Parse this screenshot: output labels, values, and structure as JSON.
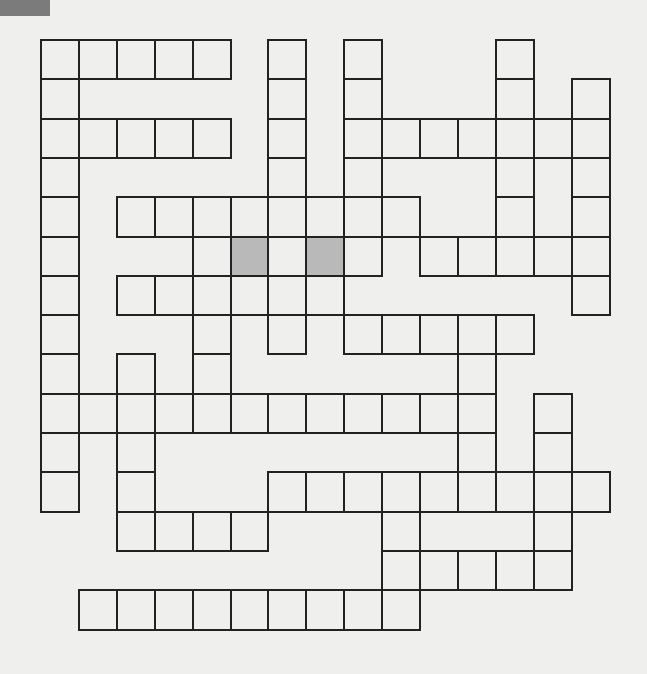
{
  "puzzle": {
    "type": "crossword-grid",
    "rows": 15,
    "cols": 15,
    "origin": {
      "x": 41,
      "y": 40
    },
    "cell_size": {
      "w": 37.9,
      "h": 39.3
    },
    "colors": {
      "background": "#efefed",
      "cell_border": "#222222",
      "cell_fill": "#efefed",
      "shaded_fill": "#b9b9b9",
      "corner_tab": "#7b7b7b"
    },
    "cells_by_row": [
      [
        0,
        1,
        2,
        3,
        4,
        6,
        8,
        12
      ],
      [
        0,
        6,
        8,
        12,
        14
      ],
      [
        0,
        1,
        2,
        3,
        4,
        6,
        8,
        9,
        10,
        11,
        12,
        13,
        14
      ],
      [
        0,
        6,
        8,
        12,
        14
      ],
      [
        0,
        2,
        3,
        4,
        5,
        6,
        7,
        8,
        9,
        12,
        14
      ],
      [
        0,
        4,
        5,
        6,
        7,
        8,
        10,
        11,
        12,
        13,
        14
      ],
      [
        0,
        2,
        3,
        4,
        5,
        6,
        7,
        14
      ],
      [
        0,
        4,
        6,
        8,
        9,
        10,
        11,
        12
      ],
      [
        0,
        2,
        4,
        11
      ],
      [
        0,
        1,
        2,
        3,
        4,
        5,
        6,
        7,
        8,
        9,
        10,
        11,
        13
      ],
      [
        0,
        2,
        11,
        13
      ],
      [
        0,
        2,
        6,
        7,
        8,
        9,
        10,
        11,
        12,
        13,
        14
      ],
      [
        2,
        3,
        4,
        5,
        9,
        13
      ],
      [
        9,
        10,
        11,
        12,
        13
      ],
      [
        1,
        2,
        3,
        4,
        5,
        6,
        7,
        8,
        9
      ]
    ],
    "shaded_cells": [
      [
        5,
        5
      ],
      [
        5,
        7
      ]
    ]
  }
}
